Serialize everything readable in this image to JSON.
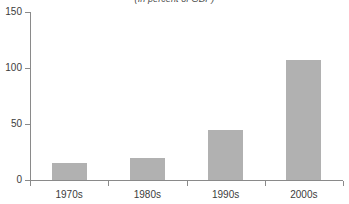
{
  "chart_data": {
    "type": "bar",
    "title": "(In percent of GDP)",
    "subtitle": "",
    "xlabel": "",
    "ylabel": "",
    "categories": [
      "1970s",
      "1980s",
      "1990s",
      "2000s"
    ],
    "values": [
      15,
      20,
      45,
      107
    ],
    "series": [
      {
        "name": "Value",
        "values": [
          15,
          20,
          45,
          107
        ]
      }
    ],
    "ylim": [
      0,
      150
    ],
    "yticks": [
      0,
      50,
      100,
      150
    ],
    "ytick_labels": [
      "0",
      "50",
      "100",
      "150"
    ],
    "grid": false,
    "legend": false,
    "legend_position": "none",
    "bar_color": "#b1b1b1",
    "axis_color": "#8a8a8a",
    "text_color": "#3c3c3c"
  }
}
